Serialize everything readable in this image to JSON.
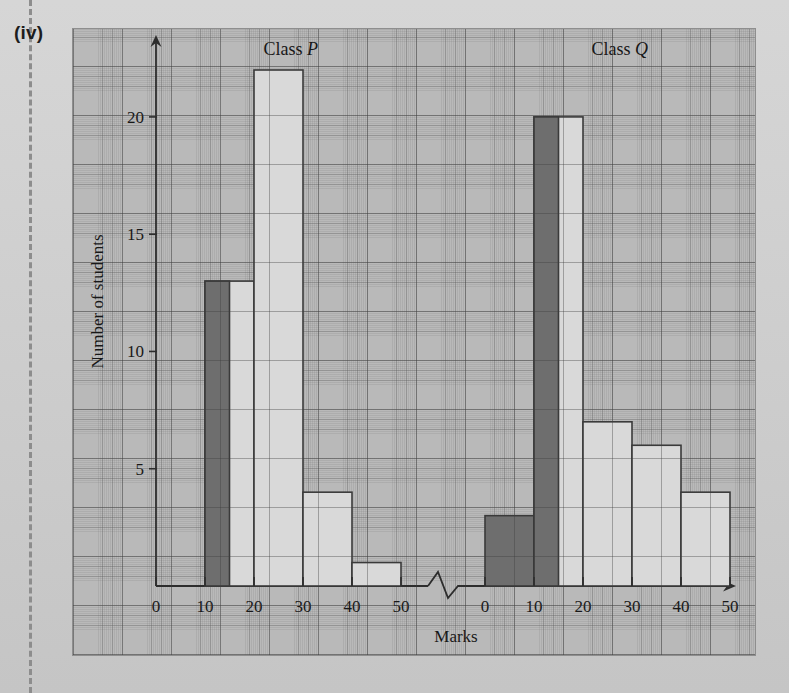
{
  "figure": {
    "part_label": "(iv)",
    "background_color": "#b9b9b9",
    "bar_light_color": "#d9d9d9",
    "bar_dark_color": "#6e6e6e",
    "axis_color": "#2d2d2d"
  },
  "chart_data": {
    "type": "bar",
    "title": "",
    "xlabel": "Marks",
    "ylabel": "Number of students",
    "ylim": [
      0,
      23
    ],
    "yticks": [
      5,
      10,
      15,
      20
    ],
    "ytick_labels": [
      "5",
      "10",
      "15",
      "20"
    ],
    "grid": true,
    "legend": "none",
    "axis_break": true,
    "panels": [
      {
        "name": "Class P",
        "title_plain": "Class ",
        "title_italic": "P",
        "xticks": [
          0,
          10,
          20,
          30,
          40,
          50
        ],
        "xtick_labels": [
          "0",
          "10",
          "20",
          "30",
          "40",
          "50"
        ],
        "bars": [
          {
            "x_start": 0,
            "x_end": 10,
            "value": 0,
            "shade": "none"
          },
          {
            "x_start": 10,
            "x_end": 20,
            "value": 13,
            "shade": "light"
          },
          {
            "x_start": 20,
            "x_end": 30,
            "value": 22,
            "shade": "light"
          },
          {
            "x_start": 30,
            "x_end": 40,
            "value": 4,
            "shade": "light"
          },
          {
            "x_start": 40,
            "x_end": 50,
            "value": 1,
            "shade": "light"
          }
        ],
        "highlights": [
          {
            "x_start": 10,
            "x_end": 15,
            "value": 13,
            "shade": "dark"
          }
        ]
      },
      {
        "name": "Class Q",
        "title_plain": "Class ",
        "title_italic": "Q",
        "xticks": [
          0,
          10,
          20,
          30,
          40,
          50
        ],
        "xtick_labels": [
          "0",
          "10",
          "20",
          "30",
          "40",
          "50"
        ],
        "bars": [
          {
            "x_start": 0,
            "x_end": 10,
            "value": 3,
            "shade": "dark"
          },
          {
            "x_start": 10,
            "x_end": 20,
            "value": 20,
            "shade": "light"
          },
          {
            "x_start": 20,
            "x_end": 30,
            "value": 7,
            "shade": "light"
          },
          {
            "x_start": 30,
            "x_end": 40,
            "value": 6,
            "shade": "light"
          },
          {
            "x_start": 40,
            "x_end": 50,
            "value": 4,
            "shade": "light"
          }
        ],
        "highlights": [
          {
            "x_start": 10,
            "x_end": 15,
            "value": 20,
            "shade": "dark"
          }
        ]
      }
    ]
  }
}
